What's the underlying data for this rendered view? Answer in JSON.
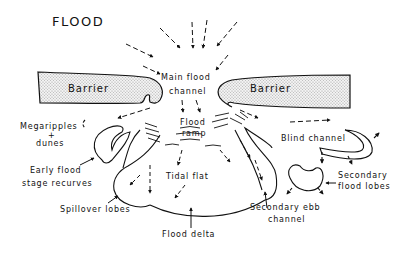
{
  "title": "FLOOD",
  "barriers": {
    "left": "Barrier",
    "right": "Barrier"
  },
  "labels": {
    "main_flood_channel_1": "Main flood",
    "main_flood_channel_2": "channel",
    "flood_ramp_1": "Flood",
    "flood_ramp_2": "ramp",
    "megaripples_1": "Megaripples",
    "megaripples_2": "+",
    "megaripples_3": "dunes",
    "early_flood_1": "Early flood",
    "early_flood_2": "stage recurves",
    "tidal_flat": "Tidal flat",
    "spillover_lobes": "Spillover lobes",
    "flood_delta": "Flood delta",
    "blind_channel": "Blind channel",
    "secondary_flood_1": "Secondary",
    "secondary_flood_2": "flood lobes",
    "secondary_ebb_1": "Secondary ebb",
    "secondary_ebb_2": "channel"
  }
}
